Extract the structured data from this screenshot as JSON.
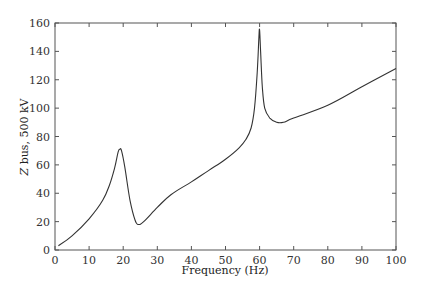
{
  "chart_data": {
    "type": "line",
    "title": "",
    "xlabel": "Frequency (Hz)",
    "ylabel": "Z bus, 500 kV",
    "xlim": [
      0,
      100
    ],
    "ylim": [
      0,
      160
    ],
    "xticks": [
      0,
      10,
      20,
      30,
      40,
      50,
      60,
      70,
      80,
      90,
      100
    ],
    "yticks": [
      0,
      20,
      40,
      60,
      80,
      100,
      120,
      140,
      160
    ],
    "grid": false,
    "legend": null,
    "line_color": "#333333",
    "series": [
      {
        "name": "Z bus, 500 kV",
        "x": [
          1,
          5,
          10,
          14,
          16,
          17.5,
          18.5,
          19,
          19.5,
          20.5,
          22,
          23.5,
          24.5,
          26,
          30,
          34,
          40,
          45,
          50,
          54,
          56,
          57.5,
          58.5,
          59.3,
          59.8,
          60,
          60.3,
          60.8,
          61.5,
          63,
          65,
          67,
          70,
          80,
          90,
          100
        ],
        "y": [
          3,
          10,
          22,
          35,
          46,
          58,
          69,
          71,
          70,
          58,
          35,
          21,
          18,
          20,
          30,
          39,
          48,
          56,
          64,
          72,
          78,
          86,
          100,
          125,
          150,
          155,
          140,
          115,
          100,
          93,
          90,
          90,
          93,
          102,
          115,
          128
        ]
      }
    ]
  }
}
